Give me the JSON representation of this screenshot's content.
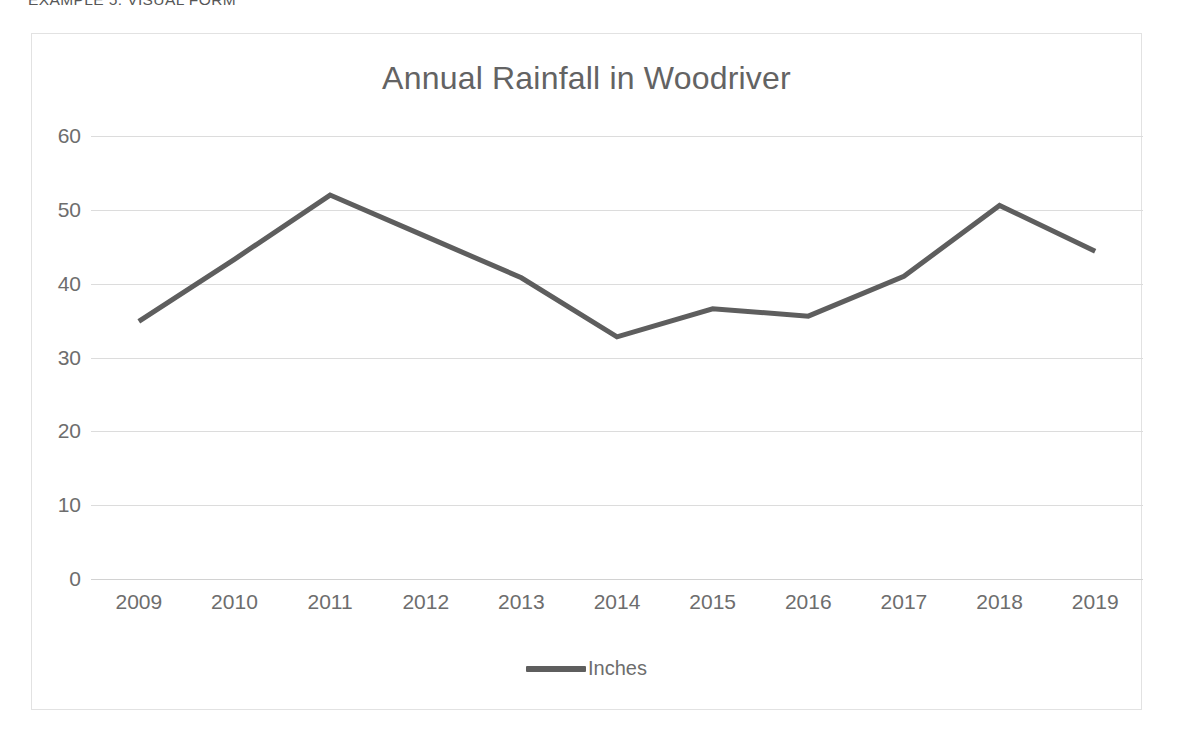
{
  "page": {
    "heading": "EXAMPLE 5: VISUAL FORM"
  },
  "chart": {
    "title": "Annual Rainfall in Woodriver",
    "legend": {
      "position": "bottom",
      "entries": [
        {
          "label": "Inches",
          "color": "#5e5e5e",
          "swatch": "line-swatch"
        }
      ]
    },
    "colors": {
      "series_line": "#5e5e5e",
      "gridline": "#dcdcdc",
      "frame_border": "#e2e2e2",
      "text": "#6d6d6d",
      "title_text": "#636363"
    }
  },
  "chart_data": {
    "type": "line",
    "title": "Annual Rainfall in Woodriver",
    "xlabel": "",
    "ylabel": "",
    "categories": [
      "2009",
      "2010",
      "2011",
      "2012",
      "2013",
      "2014",
      "2015",
      "2016",
      "2017",
      "2018",
      "2019"
    ],
    "series": [
      {
        "name": "Inches",
        "color": "#5e5e5e",
        "values": [
          34.9,
          43.3,
          52.0,
          46.4,
          40.8,
          32.8,
          36.6,
          35.6,
          41.0,
          50.6,
          44.4
        ]
      }
    ],
    "ylim": [
      0,
      60
    ],
    "yticks": [
      0,
      10,
      20,
      30,
      40,
      50,
      60
    ],
    "ytick_labels": [
      "0",
      "10",
      "20",
      "30",
      "40",
      "50",
      "60"
    ],
    "grid": true,
    "grid_axis": "y",
    "legend_position": "bottom",
    "markers": false,
    "line_width": 5
  }
}
